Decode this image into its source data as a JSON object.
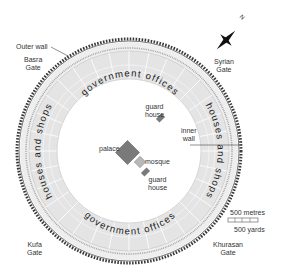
{
  "map": {
    "title": "Round City of Baghdad",
    "colors": {
      "ring_fill": "#e4e4e4",
      "ring_lines": "#ffffff",
      "wall_dark": "#3a3a3a",
      "building_fill": "#7a7a7a",
      "mosque_fill": "#b8b8b8",
      "label_text": "#333333"
    },
    "rings": {
      "outer_label": "Outer wall",
      "inner_label_line1": "inner",
      "inner_label_line2": "wall",
      "government_top": "government offices",
      "government_bottom": "government offices",
      "houses_left": "houses and shops",
      "houses_right": "houses and shops"
    },
    "gates": [
      {
        "name": "basra-gate",
        "line1": "Basra",
        "line2": "Gate"
      },
      {
        "name": "syrian-gate",
        "line1": "Syrian",
        "line2": "Gate"
      },
      {
        "name": "kufa-gate",
        "line1": "Kufa",
        "line2": "Gate"
      },
      {
        "name": "khurasan-gate",
        "line1": "Khurasan",
        "line2": "Gate"
      }
    ],
    "buildings": {
      "palace": "palace",
      "mosque": "mosque",
      "guard_house_1_line1": "guard",
      "guard_house_1_line2": "house",
      "guard_house_2_line1": "guard",
      "guard_house_2_line2": "house"
    },
    "compass": {
      "north_label": "N",
      "icon": "compass-rose-icon"
    },
    "scale": {
      "metres": "500 metres",
      "yards": "500 yards"
    }
  }
}
